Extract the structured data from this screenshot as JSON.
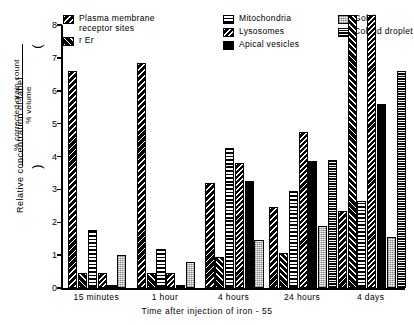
{
  "chart_data": {
    "type": "bar",
    "title": "",
    "xlabel": "Time after injection of iron-55",
    "ylabel": "Relative concentration of label",
    "ylabel_fraction_numerator": "% corrected grain count",
    "ylabel_fraction_denominator": "% volume",
    "ylim": [
      0,
      8
    ],
    "yticks": [
      0,
      1,
      2,
      3,
      4,
      5,
      6,
      7,
      8
    ],
    "ytick_labels": [
      "0",
      "1",
      "2",
      "3",
      "4",
      "5",
      "6",
      "7",
      "8"
    ],
    "grid": false,
    "legend_position": "top",
    "categories": [
      "15 minutes",
      "1 hour",
      "4 hours",
      "24 hours",
      "4 days"
    ],
    "series": [
      {
        "name": "Plasma membrane receptor sites",
        "pattern": "diagonal-hatch-black",
        "values": [
          6.6,
          6.85,
          3.2,
          2.45,
          2.35
        ]
      },
      {
        "name": "r Er",
        "pattern": "diagonal-hatch-up",
        "values": [
          0.45,
          0.45,
          0.95,
          1.05,
          8.2
        ]
      },
      {
        "name": "Mitochondria",
        "pattern": "horizontal-stripes",
        "values": [
          1.75,
          1.2,
          4.25,
          2.95,
          2.65
        ]
      },
      {
        "name": "Lysosomes",
        "pattern": "diagonal-hatch",
        "values": [
          0.45,
          0.45,
          3.8,
          4.75,
          8.2
        ]
      },
      {
        "name": "Apical vesicles",
        "pattern": "solid-black",
        "values": [
          0.1,
          0.08,
          3.25,
          3.85,
          5.6
        ]
      },
      {
        "name": "Golgi",
        "pattern": "light-stipple",
        "values": [
          1.0,
          0.8,
          1.45,
          1.9,
          1.55
        ]
      },
      {
        "name": "Colloid droplet",
        "pattern": "fine-horizontal-lines",
        "values": [
          0.0,
          0.0,
          0.0,
          3.9,
          6.6
        ]
      }
    ]
  },
  "legend": {
    "columns": [
      {
        "items": [
          {
            "label": "Plasma  membrane\nreceptor  sites",
            "swatch": "pat-pm"
          },
          {
            "label": "r Er",
            "swatch": "pat-rer"
          }
        ]
      },
      {
        "items": [
          {
            "label": "Mitochondria",
            "swatch": "pat-mito"
          },
          {
            "label": "Lysosomes",
            "swatch": "pat-lyso"
          },
          {
            "label": "Apical  vesicles",
            "swatch": "pat-apical"
          }
        ]
      },
      {
        "items": [
          {
            "label": "Golgi",
            "swatch": "pat-golgi"
          },
          {
            "label": "Colloid  droplet",
            "swatch": "pat-colloid"
          }
        ]
      }
    ]
  },
  "axes": {
    "y_title": "Relative  concentration  of  label",
    "y_numerator": "%  corrected  grain  count",
    "y_denominator": "%  volume",
    "x_title": "Time   after  injection  of  iron - 55"
  },
  "colors": {
    "ink": "#000000",
    "paper": "#ffffff",
    "golgi_fill": "#c9c9c9"
  }
}
